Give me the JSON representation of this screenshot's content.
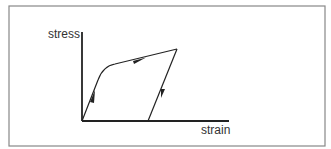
{
  "diagram": {
    "labels": {
      "y_axis": "stress",
      "x_axis": "strain"
    },
    "curve": {
      "description": "stress-strain loading and unloading path",
      "segments": [
        "elastic loading (arrow up)",
        "plastic yielding (arrow right)",
        "elastic unloading (arrow down)"
      ]
    }
  },
  "colors": {
    "line": "#222222",
    "frame": "#888888",
    "text": "#333333"
  }
}
